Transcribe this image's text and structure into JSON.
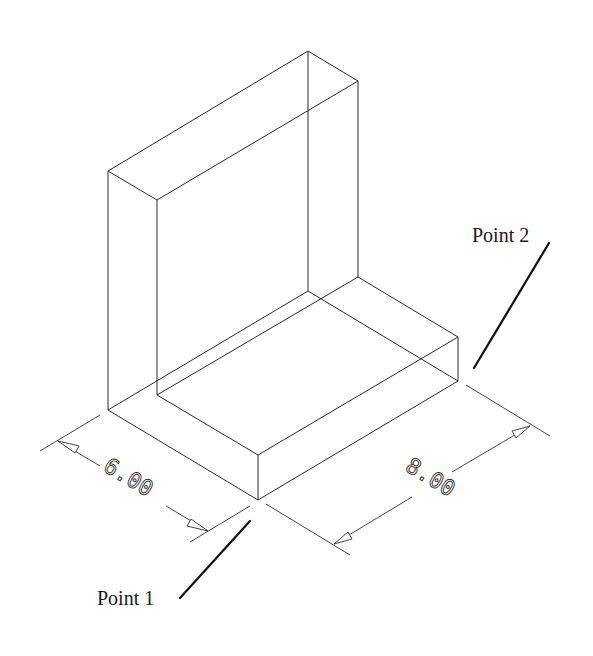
{
  "diagram": {
    "type": "isometric L-bracket wireframe",
    "stroke_color": "#2a2a2a",
    "background": "#ffffff"
  },
  "dimensions": {
    "width": {
      "value": "6.00"
    },
    "length": {
      "value": "8.00"
    }
  },
  "labels": {
    "point1": "Point 1",
    "point2": "Point 2"
  }
}
